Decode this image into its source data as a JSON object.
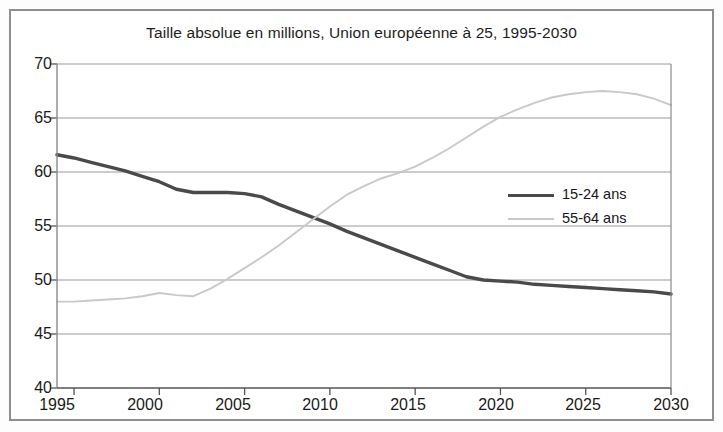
{
  "chart_data": {
    "type": "line",
    "title": "Taille absolue en millions, Union européenne à 25, 1995-2030",
    "xlabel": "",
    "ylabel": "",
    "xlim": [
      1994,
      2030
    ],
    "ylim": [
      40,
      70
    ],
    "xticks": [
      "1995",
      "2000",
      "2005",
      "2010",
      "2015",
      "2020",
      "2025",
      "2030"
    ],
    "xtick_values": [
      1995,
      2000,
      2005,
      2010,
      2015,
      2020,
      2025,
      2030
    ],
    "yticks": [
      "40",
      "45",
      "50",
      "55",
      "60",
      "65",
      "70"
    ],
    "ytick_values": [
      40,
      45,
      50,
      55,
      60,
      65,
      70
    ],
    "grid": "horizontal",
    "legend_position": "center-right",
    "series": [
      {
        "name": "15-24 ans",
        "color": "#4a4a4a",
        "x": [
          1994,
          1995,
          1996,
          1997,
          1998,
          1999,
          2000,
          2001,
          2002,
          2003,
          2004,
          2005,
          2006,
          2007,
          2008,
          2009,
          2010,
          2011,
          2012,
          2013,
          2014,
          2015,
          2016,
          2017,
          2018,
          2019,
          2020,
          2021,
          2022,
          2023,
          2024,
          2025,
          2026,
          2027,
          2028,
          2029,
          2030
        ],
        "values": [
          61.6,
          61.3,
          60.9,
          60.5,
          60.1,
          59.6,
          59.1,
          58.4,
          58.1,
          58.1,
          58.1,
          58.0,
          57.7,
          57.0,
          56.4,
          55.8,
          55.2,
          54.5,
          53.9,
          53.3,
          52.7,
          52.1,
          51.5,
          50.9,
          50.3,
          50.0,
          49.9,
          49.8,
          49.6,
          49.5,
          49.4,
          49.3,
          49.2,
          49.1,
          49.0,
          48.9,
          48.7
        ]
      },
      {
        "name": "55-64 ans",
        "color": "#c9c9c9",
        "x": [
          1994,
          1995,
          1996,
          1997,
          1998,
          1999,
          2000,
          2001,
          2002,
          2003,
          2004,
          2005,
          2006,
          2007,
          2008,
          2009,
          2010,
          2011,
          2012,
          2013,
          2014,
          2015,
          2016,
          2017,
          2018,
          2019,
          2020,
          2021,
          2022,
          2023,
          2024,
          2025,
          2026,
          2027,
          2028,
          2029,
          2030
        ],
        "values": [
          48.0,
          48.0,
          48.1,
          48.2,
          48.3,
          48.5,
          48.8,
          48.6,
          48.5,
          49.2,
          50.1,
          51.1,
          52.1,
          53.2,
          54.4,
          55.6,
          56.8,
          57.9,
          58.7,
          59.4,
          59.9,
          60.5,
          61.3,
          62.2,
          63.2,
          64.2,
          65.1,
          65.8,
          66.4,
          66.9,
          67.2,
          67.4,
          67.5,
          67.4,
          67.2,
          66.8,
          66.2
        ]
      }
    ],
    "annotations": {
      "crossover_year": 2008,
      "crossover_value": 56.0,
      "peak_55_64_year": 2026,
      "peak_55_64_value": 67.5
    }
  },
  "legend": {
    "entries": [
      {
        "label": "15-24 ans",
        "color": "#4a4a4a"
      },
      {
        "label": "55-64 ans",
        "color": "#c9c9c9"
      }
    ]
  },
  "axes": {
    "y_labels": [
      "70",
      "65",
      "60",
      "55",
      "50",
      "45",
      "40"
    ],
    "x_labels": [
      "1995",
      "2000",
      "2005",
      "2010",
      "2015",
      "2020",
      "2025",
      "2030"
    ]
  }
}
